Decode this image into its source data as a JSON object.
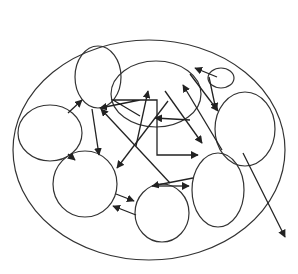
{
  "diagram": {
    "type": "nested-ellipse-network",
    "stroke_color": "#333333",
    "background": "#ffffff",
    "outer": {
      "id": "outer",
      "cx": 149,
      "cy": 150,
      "rx": 136,
      "ry": 110
    },
    "nodes": [
      {
        "id": "left",
        "cx": 50,
        "cy": 133,
        "rx": 32,
        "ry": 28
      },
      {
        "id": "top-left",
        "cx": 98,
        "cy": 77,
        "rx": 23,
        "ry": 31
      },
      {
        "id": "center-top",
        "cx": 156,
        "cy": 94,
        "rx": 45,
        "ry": 33
      },
      {
        "id": "small-top",
        "cx": 221,
        "cy": 78,
        "rx": 13,
        "ry": 10
      },
      {
        "id": "right",
        "cx": 245,
        "cy": 129,
        "rx": 30,
        "ry": 37
      },
      {
        "id": "bottom-left",
        "cx": 85,
        "cy": 184,
        "rx": 32,
        "ry": 33
      },
      {
        "id": "bottom-mid",
        "cx": 162,
        "cy": 213,
        "rx": 27,
        "ry": 29
      },
      {
        "id": "bottom-right",
        "cx": 218,
        "cy": 190,
        "rx": 26,
        "ry": 37
      }
    ],
    "arrows": [
      {
        "from": [
          68,
          113
        ],
        "to": [
          82,
          100
        ]
      },
      {
        "from": [
          68,
          154
        ],
        "to": [
          75,
          160
        ]
      },
      {
        "from": [
          92,
          109
        ],
        "to": [
          99,
          155
        ]
      },
      {
        "from": [
          140,
          116
        ],
        "to": [
          100,
          108
        ],
        "elbow": [
          113,
          100,
          140,
          100
        ]
      },
      {
        "from": [
          136,
          146
        ],
        "to": [
          148,
          91
        ]
      },
      {
        "from": [
          168,
          101
        ],
        "to": [
          117,
          168
        ]
      },
      {
        "from": [
          170,
          183
        ],
        "to": [
          101,
          109
        ]
      },
      {
        "from": [
          165,
          91
        ],
        "to": [
          202,
          143
        ]
      },
      {
        "from": [
          222,
          150
        ],
        "to": [
          183,
          85
        ]
      },
      {
        "from": [
          140,
          100
        ],
        "to": [
          198,
          155
        ],
        "elbow": [
          157,
          100,
          157,
          155
        ]
      },
      {
        "from": [
          190,
          120
        ],
        "to": [
          155,
          118
        ]
      },
      {
        "from": [
          217,
          77
        ],
        "to": [
          195,
          68
        ]
      },
      {
        "from": [
          209,
          77
        ],
        "to": [
          216,
          110
        ]
      },
      {
        "from": [
          190,
          74
        ],
        "to": [
          218,
          111
        ]
      },
      {
        "from": [
          116,
          194
        ],
        "to": [
          134,
          201
        ]
      },
      {
        "from": [
          136,
          215
        ],
        "to": [
          113,
          206
        ]
      },
      {
        "from": [
          193,
          178
        ],
        "to": [
          152,
          186
        ]
      },
      {
        "from": [
          158,
          186
        ],
        "to": [
          189,
          186
        ]
      },
      {
        "from": [
          243,
          153
        ],
        "to": [
          285,
          237
        ]
      }
    ],
    "caption_fragments": [
      "’",
      "’"
    ]
  }
}
